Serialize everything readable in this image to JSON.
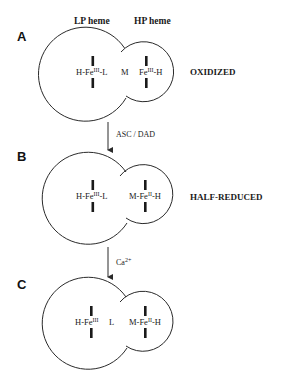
{
  "headers": {
    "lp": "LP heme",
    "hp": "HP heme"
  },
  "panels": [
    {
      "letter": "A",
      "state": "OXIDIZED",
      "lp_label": {
        "pre": "H-Fe",
        "sup": "III",
        "post": "-L"
      },
      "mid_label": "M",
      "hp_label": {
        "pre": "Fe",
        "sup": "III",
        "post": "-H"
      }
    },
    {
      "letter": "B",
      "state": "HALF-REDUCED",
      "lp_label": {
        "pre": "H-Fe",
        "sup": "III",
        "post": "-L"
      },
      "mid_label": "",
      "hp_label": {
        "pre": "M-Fe",
        "sup": "II",
        "post": "-H"
      }
    },
    {
      "letter": "C",
      "state": "",
      "lp_label": {
        "pre": "H-Fe",
        "sup": "III",
        "post": ""
      },
      "mid_label": "L",
      "hp_label": {
        "pre": "M-Fe",
        "sup": "II",
        "post": "-H"
      }
    }
  ],
  "arrows": [
    {
      "label": "ASC / DAD"
    },
    {
      "label_main": "Ca",
      "label_sup": "2+"
    }
  ],
  "colors": {
    "stroke": "#2a2a2a",
    "background": "#ffffff"
  }
}
